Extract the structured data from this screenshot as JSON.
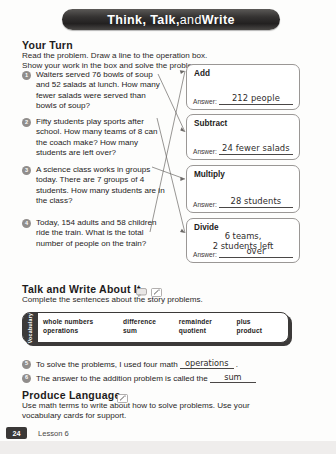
{
  "banner": {
    "title_bold_1": "Think, Talk,",
    "title_light": " and ",
    "title_bold_2": "Write"
  },
  "your_turn": {
    "heading": "Your Turn",
    "instructions": "Read the problem. Draw a line to the operation box. Show your work in the box and solve the problem."
  },
  "problems": [
    {
      "number": "1",
      "text": "Waiters served 76 bowls of soup and 52 salads at lunch. How many fewer salads were served than bowls of soup?"
    },
    {
      "number": "2",
      "text": "Fifty students play sports after school. How many teams of 8 can the coach make? How many students are left over?"
    },
    {
      "number": "3",
      "text": "A science class works in groups today. There are 7 groups of 4 students. How many students are in the class?"
    },
    {
      "number": "4",
      "text": "Today, 154 adults and 58 children ride the train. What is the total number of people on the train?"
    }
  ],
  "operation_boxes": [
    {
      "title": "Add",
      "answer_label": "Answer:",
      "answer_value": "212 people"
    },
    {
      "title": "Subtract",
      "answer_label": "Answer:",
      "answer_value": "24 fewer salads"
    },
    {
      "title": "Multiply",
      "answer_label": "Answer:",
      "answer_value": "28 students"
    },
    {
      "title": "Divide",
      "answer_label": "Answer:",
      "answer_value": "over",
      "answer_value_line1": "6 teams,",
      "answer_value_line2": "2 students left"
    }
  ],
  "talk_write": {
    "heading": "Talk and Write About It",
    "instructions": "Complete the sentences about the story problems.",
    "speak_icon": "speech-bubble-icon",
    "pencil_icon": "pencil-icon"
  },
  "vocabulary": {
    "tab_label": "Vocabulary",
    "column1": [
      "whole numbers",
      "operations"
    ],
    "column2": [
      "difference",
      "sum"
    ],
    "column3": [
      "remainder",
      "quotient"
    ],
    "column4": [
      "plus",
      "product"
    ]
  },
  "sentences": [
    {
      "number": "5",
      "before": "To solve the problems, I used four math",
      "answer": "operations",
      "after": "."
    },
    {
      "number": "6",
      "before": "The answer to the addition problem is called the",
      "answer": "sum",
      "after": ""
    }
  ],
  "produce_language": {
    "heading": "Produce Language",
    "pencil_icon": "pencil-icon",
    "instructions": "Use math terms to write about how to solve problems. Use your vocabulary cards for support."
  },
  "footer": {
    "page_number": "24",
    "lesson_label": "Lesson 6"
  }
}
